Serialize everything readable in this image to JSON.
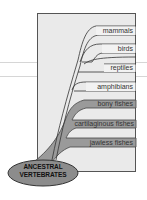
{
  "diagram": {
    "root": {
      "label_line1": "ANCESTRAL",
      "label_line2": "VERTEBRATES"
    },
    "taxa": [
      {
        "label": "mammals",
        "filled": false
      },
      {
        "label": "birds",
        "filled": false
      },
      {
        "label": "reptiles",
        "filled": false
      },
      {
        "label": "amphibians",
        "filled": false
      },
      {
        "label": "bony fishes",
        "filled": true
      },
      {
        "label": "cartilaginous fishes",
        "filled": true
      },
      {
        "label": "jawless fishes",
        "filled": true
      }
    ],
    "colors": {
      "box_bg": "#eaeaea",
      "box_border": "#555555",
      "bar_filled": "#9a9a9a",
      "bar_unfilled": "#f2f2f2",
      "ellipse": "#8c8c8c"
    }
  }
}
